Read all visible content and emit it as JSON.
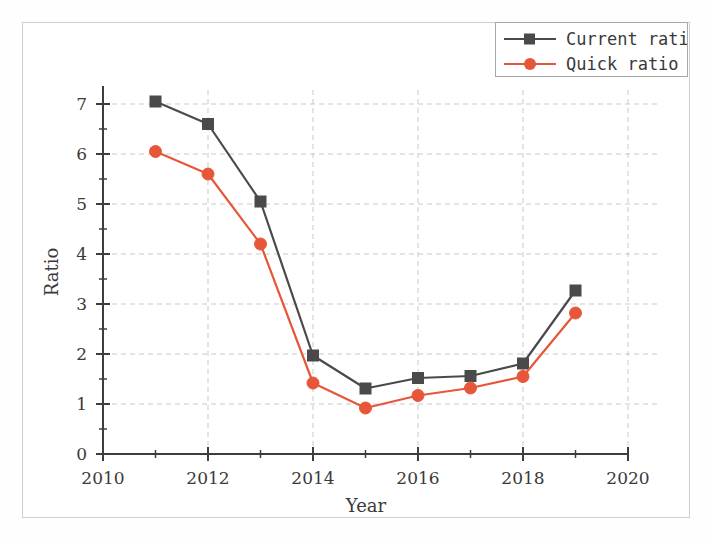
{
  "chart_data": {
    "type": "line",
    "title": "",
    "xlabel": "Year",
    "ylabel": "Ratio",
    "x": [
      2011,
      2012,
      2013,
      2014,
      2015,
      2016,
      2017,
      2018,
      2019
    ],
    "xlim": [
      2010,
      2020
    ],
    "ylim": [
      0,
      7
    ],
    "xticks": [
      2010,
      2012,
      2014,
      2016,
      2018,
      2020
    ],
    "xtick_labels": [
      "2010",
      "2012",
      "2014",
      "2016",
      "2018",
      "2020"
    ],
    "xminor_ticks": [
      2011,
      2013,
      2015,
      2017,
      2019
    ],
    "yticks": [
      0,
      1,
      2,
      3,
      4,
      5,
      6,
      7
    ],
    "ytick_labels": [
      "0",
      "1",
      "2",
      "3",
      "4",
      "5",
      "6",
      "7"
    ],
    "yminor_ticks": [
      0.5,
      1.5,
      2.5,
      3.5,
      4.5,
      5.5,
      6.5
    ],
    "grid": true,
    "grid_style": "dashed",
    "legend_position": "top-right",
    "series": [
      {
        "name": "Current ratio",
        "marker": "square",
        "color": "#4a4a4a",
        "values": [
          7.05,
          6.6,
          5.05,
          1.97,
          1.31,
          1.52,
          1.56,
          1.81,
          3.27
        ]
      },
      {
        "name": "Quick ratio",
        "marker": "circle",
        "color": "#e8563a",
        "values": [
          6.05,
          5.6,
          4.2,
          1.42,
          0.92,
          1.17,
          1.32,
          1.55,
          2.82
        ]
      }
    ]
  },
  "colors": {
    "current_ratio": "#4a4a4a",
    "quick_ratio": "#e8563a",
    "grid": "#c9c9c9",
    "axis": "#3d3d3d",
    "frame": "#cfcfcf",
    "text": "#3a3a3a"
  },
  "legend": {
    "items": [
      {
        "label": "Current ratio",
        "color": "#4a4a4a",
        "marker": "square"
      },
      {
        "label": "Quick ratio",
        "color": "#e8563a",
        "marker": "circle"
      }
    ]
  },
  "axes": {
    "x_title": "Year",
    "y_title": "Ratio"
  }
}
